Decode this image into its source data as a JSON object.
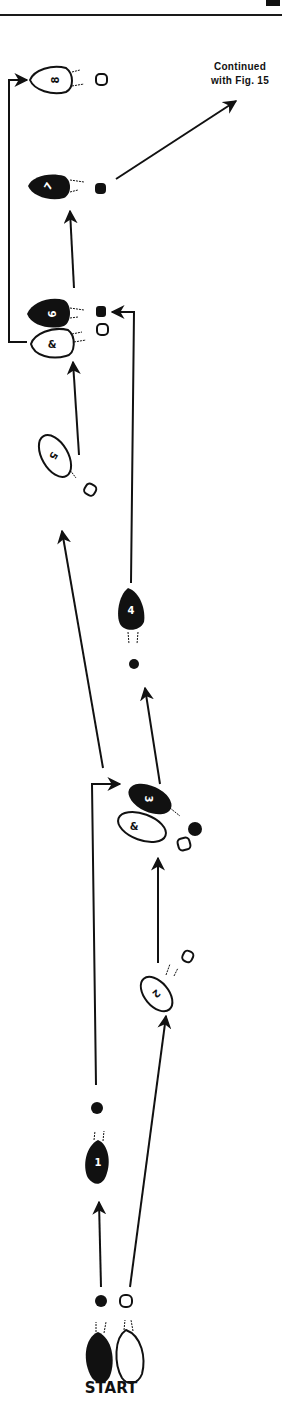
{
  "page": {
    "top_rule": true
  },
  "caption": {
    "line1": "Continued",
    "line2": "with Fig. 15"
  },
  "start_label": "START",
  "colors": {
    "ink": "#111111",
    "paper": "#ffffff"
  },
  "steps": [
    {
      "id": "start-left",
      "label": "",
      "fill": "black",
      "foot": "left"
    },
    {
      "id": "start-right",
      "label": "",
      "fill": "white",
      "foot": "right"
    },
    {
      "id": "1",
      "label": "1",
      "fill": "black",
      "foot": "left"
    },
    {
      "id": "2",
      "label": "2",
      "fill": "white",
      "foot": "right"
    },
    {
      "id": "3",
      "label": "3",
      "fill": "black",
      "foot": "left"
    },
    {
      "id": "3a",
      "label": "&",
      "fill": "white",
      "foot": "right"
    },
    {
      "id": "4",
      "label": "4",
      "fill": "black",
      "foot": "left"
    },
    {
      "id": "5",
      "label": "5",
      "fill": "white",
      "foot": "right"
    },
    {
      "id": "6",
      "label": "6",
      "fill": "black",
      "foot": "left"
    },
    {
      "id": "6a",
      "label": "&",
      "fill": "white",
      "foot": "right"
    },
    {
      "id": "7",
      "label": "7",
      "fill": "black",
      "foot": "left"
    },
    {
      "id": "8",
      "label": "8",
      "fill": "white",
      "foot": "right"
    }
  ]
}
